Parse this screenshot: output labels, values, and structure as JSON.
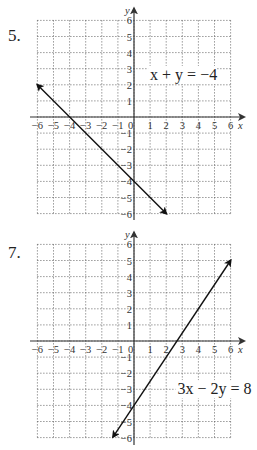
{
  "problems": [
    {
      "number": "5.",
      "equation_label": "x + y = −4",
      "chart": {
        "type": "line",
        "xlim": [
          -6,
          6
        ],
        "ylim": [
          -6,
          6
        ],
        "xlabel": "x",
        "ylabel": "y",
        "x_ticks": [
          "−6",
          "−5",
          "−4",
          "−3",
          "−2",
          "−1",
          "0",
          "1",
          "2",
          "3",
          "4",
          "5",
          "6"
        ],
        "y_ticks": [
          "6",
          "5",
          "4",
          "3",
          "2",
          "1",
          "−1",
          "−2",
          "−3",
          "−4",
          "−5",
          "−6"
        ],
        "line": {
          "from": [
            -6,
            2
          ],
          "to": [
            2,
            -6
          ]
        },
        "label_pos": [
          1,
          2.3
        ]
      }
    },
    {
      "number": "7.",
      "equation_label": "3x − 2y = 8",
      "chart": {
        "type": "line",
        "xlim": [
          -6,
          6
        ],
        "ylim": [
          -6,
          6
        ],
        "xlabel": "x",
        "ylabel": "y",
        "x_ticks": [
          "−6",
          "−5",
          "−4",
          "−3",
          "−2",
          "−1",
          "0",
          "1",
          "2",
          "3",
          "4",
          "5",
          "6"
        ],
        "y_ticks": [
          "6",
          "5",
          "4",
          "3",
          "2",
          "1",
          "−1",
          "−2",
          "−3",
          "−4",
          "−5",
          "−6"
        ],
        "line": {
          "from": [
            -1.3,
            -5.95
          ],
          "to": [
            6,
            5
          ]
        },
        "label_pos": [
          2.7,
          -3.3
        ]
      }
    }
  ],
  "chart_data": [
    {
      "type": "line",
      "title": "5. x + y = −4",
      "xlabel": "x",
      "ylabel": "y",
      "xlim": [
        -6,
        6
      ],
      "ylim": [
        -6,
        6
      ],
      "grid": true,
      "series": [
        {
          "name": "x + y = −4",
          "x": [
            -6,
            -4,
            0,
            2
          ],
          "y": [
            2,
            0,
            -4,
            -6
          ]
        }
      ],
      "annotations": [
        "x + y = −4"
      ]
    },
    {
      "type": "line",
      "title": "7. 3x − 2y = 8",
      "xlabel": "x",
      "ylabel": "y",
      "xlim": [
        -6,
        6
      ],
      "ylim": [
        -6,
        6
      ],
      "grid": true,
      "series": [
        {
          "name": "3x − 2y = 8",
          "x": [
            -1.33,
            0,
            2.67,
            6
          ],
          "y": [
            -6,
            -4,
            0,
            5
          ]
        }
      ],
      "annotations": [
        "3x − 2y = 8"
      ]
    }
  ]
}
